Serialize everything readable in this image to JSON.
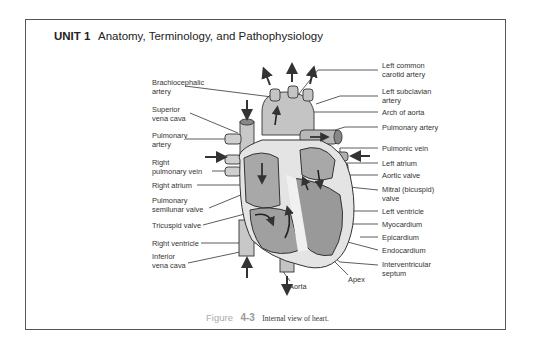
{
  "header": {
    "unit": "UNIT 1",
    "title": "Anatomy, Terminology, and Pathophysiology"
  },
  "labels_left": [
    {
      "id": "brachiocephalic-artery",
      "text": "Brachiocephalic\nartery",
      "x": 152,
      "y": 79
    },
    {
      "id": "superior-vena-cava",
      "text": "Superior\nvena cava",
      "x": 152,
      "y": 106
    },
    {
      "id": "pulmonary-artery-left",
      "text": "Pulmonary\nartery",
      "x": 152,
      "y": 132
    },
    {
      "id": "right-pulmonary-vein",
      "text": "Right\npulmonary vein",
      "x": 152,
      "y": 159
    },
    {
      "id": "right-atrium",
      "text": "Right atrium",
      "x": 152,
      "y": 182
    },
    {
      "id": "pulmonary-semilunar-valve",
      "text": "Pulmonary\nsemilunar valve",
      "x": 152,
      "y": 197
    },
    {
      "id": "tricuspid-valve",
      "text": "Tricuspid valve",
      "x": 152,
      "y": 222
    },
    {
      "id": "right-ventricle",
      "text": "Right ventricle",
      "x": 152,
      "y": 240
    },
    {
      "id": "inferior-vena-cava",
      "text": "Inferior\nvena cava",
      "x": 152,
      "y": 253
    }
  ],
  "labels_right": [
    {
      "id": "left-common-carotid-artery",
      "text": "Left common\ncarotid artery",
      "x": 382,
      "y": 62
    },
    {
      "id": "left-subclavian-artery",
      "text": "Left subclavian\nartery",
      "x": 382,
      "y": 88
    },
    {
      "id": "arch-of-aorta",
      "text": "Arch of aorta",
      "x": 382,
      "y": 109
    },
    {
      "id": "pulmonary-artery-right",
      "text": "Pulmonary artery",
      "x": 382,
      "y": 124
    },
    {
      "id": "pulmonic-vein",
      "text": "Pulmonic vein",
      "x": 382,
      "y": 145
    },
    {
      "id": "left-atrium",
      "text": "Left atrium",
      "x": 382,
      "y": 160
    },
    {
      "id": "aortic-valve",
      "text": "Aortic valve",
      "x": 382,
      "y": 172
    },
    {
      "id": "mitral-valve",
      "text": "Mitral (bicuspid)\nvalve",
      "x": 382,
      "y": 186
    },
    {
      "id": "left-ventricle",
      "text": "Left ventricle",
      "x": 382,
      "y": 208
    },
    {
      "id": "myocardium",
      "text": "Myocardium",
      "x": 382,
      "y": 221
    },
    {
      "id": "epicardium",
      "text": "Epicardium",
      "x": 382,
      "y": 234
    },
    {
      "id": "endocardium",
      "text": "Endocardium",
      "x": 382,
      "y": 247
    },
    {
      "id": "interventricular-septum",
      "text": "Interventricular\nseptum",
      "x": 382,
      "y": 261
    }
  ],
  "labels_bottom": [
    {
      "id": "aorta",
      "text": "Aorta",
      "x": 287,
      "y": 283
    },
    {
      "id": "apex",
      "text": "Apex",
      "x": 348,
      "y": 276
    }
  ],
  "caption": {
    "figure_word": "Figure",
    "figure_number": "4-3",
    "text": "Internal view of heart."
  },
  "colors": {
    "frame": "#555555",
    "heart_fill": "#bdbdbd",
    "heart_dark": "#9e9e9e",
    "heart_light": "#e6e6e6",
    "line": "#333333"
  }
}
